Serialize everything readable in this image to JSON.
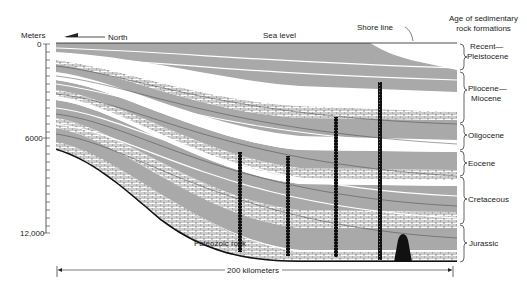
{
  "axis": {
    "title": "Meters",
    "ticks": [
      "0",
      "6000",
      "12,000"
    ]
  },
  "labels": {
    "north": "North",
    "sea_level": "Sea level",
    "shore_line": "Shore line",
    "paleozoic": "Paleozoic rock",
    "scale": "200 kilometers",
    "legend_title_1": "Age of sedimentary",
    "legend_title_2": "rock formations"
  },
  "formations": [
    {
      "line1": "Recent—",
      "line2": "Pleistocene"
    },
    {
      "line1": "Pliocene—",
      "line2": "Miocene"
    },
    {
      "line1": "Oligocene",
      "line2": ""
    },
    {
      "line1": "Eocene",
      "line2": ""
    },
    {
      "line1": "Cretaceous",
      "line2": ""
    },
    {
      "line1": "Jurassic",
      "line2": ""
    }
  ],
  "colors": {
    "shale": "#a9a9a9",
    "sand": "#ffffff",
    "ink": "#1a1a1a"
  }
}
